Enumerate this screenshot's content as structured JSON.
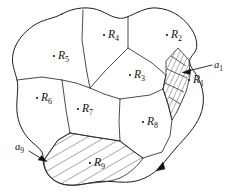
{
  "figure": {
    "background_color": "#ffffff",
    "line_color": "#2b2b2b",
    "boundary_color": "#1e1e1e",
    "label_color": "#111111",
    "width": 243,
    "height": 193
  },
  "regions": [
    {
      "id": "R1",
      "name": "R",
      "subscript": "1",
      "label": "R₁",
      "label_x": 196,
      "label_y": 83,
      "dot_x": 189,
      "dot_y": 80,
      "hatched": false
    },
    {
      "id": "R2",
      "name": "R",
      "subscript": "2",
      "label": "R₂",
      "label_x": 174,
      "label_y": 38,
      "dot_x": 167,
      "dot_y": 35,
      "hatched": false
    },
    {
      "id": "R3",
      "name": "R",
      "subscript": "3",
      "label": "R₃",
      "label_x": 137,
      "label_y": 78,
      "dot_x": 130,
      "dot_y": 75,
      "hatched": false
    },
    {
      "id": "R4",
      "name": "R",
      "subscript": "4",
      "label": "R₄",
      "label_x": 111,
      "label_y": 38,
      "dot_x": 104,
      "dot_y": 35,
      "hatched": false
    },
    {
      "id": "R5",
      "name": "R",
      "subscript": "5",
      "label": "R₅",
      "label_x": 61,
      "label_y": 59,
      "dot_x": 54,
      "dot_y": 56,
      "hatched": false
    },
    {
      "id": "R6",
      "name": "R",
      "subscript": "6",
      "label": "R₆",
      "label_x": 44,
      "label_y": 101,
      "dot_x": 37,
      "dot_y": 98,
      "hatched": false
    },
    {
      "id": "R7",
      "name": "R",
      "subscript": "7",
      "label": "R₇",
      "label_x": 85,
      "label_y": 112,
      "dot_x": 78,
      "dot_y": 109,
      "hatched": false
    },
    {
      "id": "R8",
      "name": "R",
      "subscript": "8",
      "label": "R₈",
      "label_x": 150,
      "label_y": 125,
      "dot_x": 143,
      "dot_y": 122,
      "hatched": false
    },
    {
      "id": "R9",
      "name": "R",
      "subscript": "9",
      "label": "R₉",
      "label_x": 97,
      "label_y": 166,
      "dot_x": 90,
      "dot_y": 163,
      "hatched": true
    }
  ],
  "strip_annotations": [
    {
      "id": "a1",
      "name": "a",
      "subscript": "1",
      "label": "a₁",
      "label_x": 216,
      "label_y": 66,
      "leader_from_x": 212,
      "leader_from_y": 65,
      "leader_to_x": 186,
      "leader_to_y": 72,
      "arrow_tip_x": 183,
      "arrow_tip_y": 73,
      "arrow_angle_deg": 192,
      "describes": "hatched strip at right boundary"
    },
    {
      "id": "a9",
      "name": "a",
      "subscript": "9",
      "label": "a₉",
      "label_x": 20,
      "label_y": 148,
      "leader_from_x": 27,
      "leader_from_y": 150,
      "leader_to_x": 43,
      "leader_to_y": 160,
      "arrow_tip_x": 46,
      "arrow_tip_y": 161,
      "arrow_angle_deg": 28,
      "describes": "hatched region R9 at lower left"
    }
  ],
  "boundary_markers": [
    {
      "id": "orientation-arrow-bottom-right",
      "tip_x": 160,
      "tip_y": 169,
      "angle_deg": 243
    }
  ]
}
